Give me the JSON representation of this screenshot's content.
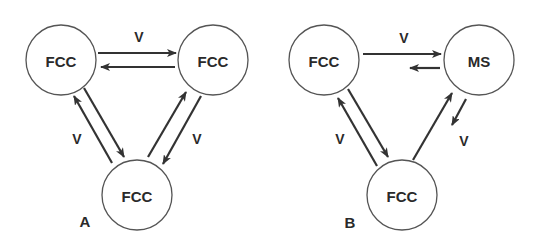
{
  "diagram": {
    "panels": [
      {
        "id": "A",
        "label": "A",
        "nodes": [
          {
            "id": "a1",
            "label": "FCC"
          },
          {
            "id": "a2",
            "label": "FCC"
          },
          {
            "id": "a3",
            "label": "FCC"
          }
        ],
        "edges": [
          {
            "from": "a1",
            "to": "a2",
            "label": "V",
            "weight": "equal"
          },
          {
            "from": "a2",
            "to": "a1",
            "label": "",
            "weight": "equal"
          },
          {
            "from": "a1",
            "to": "a3",
            "label": "V",
            "weight": "equal"
          },
          {
            "from": "a3",
            "to": "a1",
            "label": "",
            "weight": "equal"
          },
          {
            "from": "a2",
            "to": "a3",
            "label": "V",
            "weight": "equal"
          },
          {
            "from": "a3",
            "to": "a2",
            "label": "",
            "weight": "equal"
          }
        ]
      },
      {
        "id": "B",
        "label": "B",
        "nodes": [
          {
            "id": "b1",
            "label": "FCC"
          },
          {
            "id": "b2",
            "label": "MS"
          },
          {
            "id": "b3",
            "label": "FCC"
          }
        ],
        "edges": [
          {
            "from": "b1",
            "to": "b2",
            "label": "V",
            "weight": "long"
          },
          {
            "from": "b2",
            "to": "b1",
            "label": "",
            "weight": "short"
          },
          {
            "from": "b1",
            "to": "b3",
            "label": "V",
            "weight": "equal"
          },
          {
            "from": "b3",
            "to": "b1",
            "label": "",
            "weight": "equal"
          },
          {
            "from": "b3",
            "to": "b2",
            "label": "",
            "weight": "long"
          },
          {
            "from": "b2",
            "to": "b3",
            "label": "V",
            "weight": "short"
          }
        ]
      }
    ],
    "edge_symbol": "V"
  }
}
